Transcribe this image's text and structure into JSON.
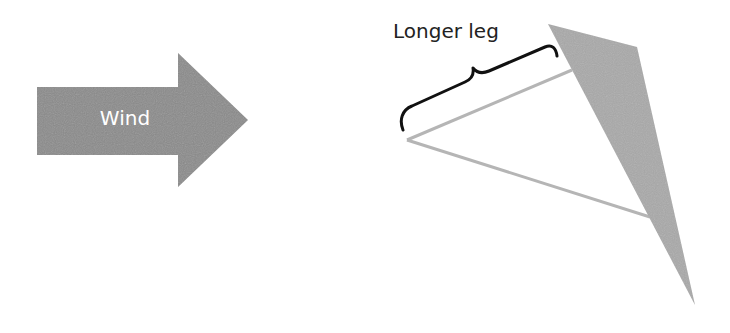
{
  "diagram": {
    "wind_arrow": {
      "label": "Wind",
      "fill": "#8a8a8a",
      "text_color": "#ffffff"
    },
    "brace_label": "Longer leg",
    "kite_sail": {
      "fill": "#a9a9a9"
    },
    "string_line": {
      "stroke": "#b5b5b5"
    },
    "brace": {
      "stroke": "#111111"
    }
  }
}
